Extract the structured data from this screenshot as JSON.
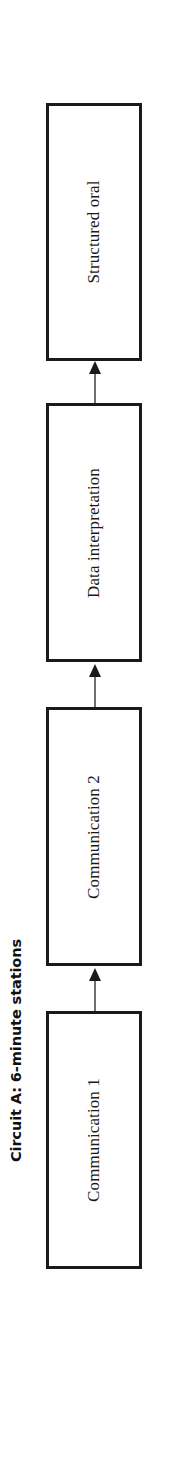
{
  "figure": {
    "title": "Circuit A: 6-minute stations",
    "orientation": "rotated-90-ccw",
    "background_color": "#ffffff",
    "box_border_color": "#1a1a1a",
    "arrow_color": "#1a1a1a",
    "arrow_shaft_color": "#6f6f6f",
    "text_color": "#1a1a1a"
  },
  "flow": {
    "direction": "bottom-to-top",
    "nodes": [
      {
        "label": "Structured oral"
      },
      {
        "label": "Data interpretation"
      },
      {
        "label": "Communication 2"
      },
      {
        "label": "Communication 1"
      }
    ],
    "connectors": [
      {
        "from": "Data interpretation",
        "to": "Structured oral",
        "style": "solid-arrow-up"
      },
      {
        "from": "Communication 2",
        "to": "Data interpretation",
        "style": "solid-arrow-up"
      },
      {
        "from": "Communication 1",
        "to": "Communication 2",
        "style": "solid-arrow-up"
      }
    ]
  }
}
